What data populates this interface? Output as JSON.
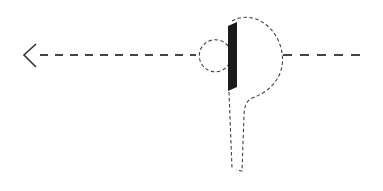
{
  "diagram": {
    "colors": {
      "stroke": "#333333",
      "bar": "#1a1a1a",
      "background": "#ffffff"
    },
    "elements": [
      {
        "name": "arrow-left",
        "type": "arrowhead",
        "direction": "left"
      },
      {
        "name": "direction-line-left",
        "type": "dashed-line"
      },
      {
        "name": "ball-circle",
        "type": "dashed-circle"
      },
      {
        "name": "paddle-bar",
        "type": "solid-bar"
      },
      {
        "name": "swing-loop",
        "type": "dashed-path"
      },
      {
        "name": "direction-line-right",
        "type": "dashed-line"
      }
    ]
  }
}
